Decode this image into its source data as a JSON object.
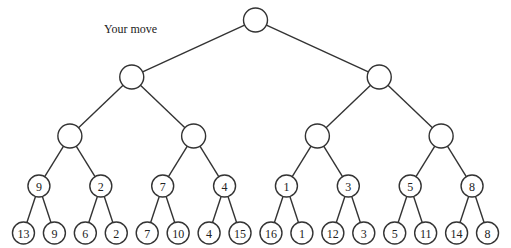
{
  "diagram": {
    "type": "game-tree",
    "annotation": "Your move",
    "root": {
      "value": "",
      "children": [
        {
          "value": "",
          "children": [
            {
              "value": "",
              "children": [
                {
                  "value": "9",
                  "children": [
                    {
                      "value": "13"
                    },
                    {
                      "value": "9"
                    }
                  ]
                },
                {
                  "value": "2",
                  "children": [
                    {
                      "value": "6"
                    },
                    {
                      "value": "2"
                    }
                  ]
                }
              ]
            },
            {
              "value": "",
              "children": [
                {
                  "value": "7",
                  "children": [
                    {
                      "value": "7"
                    },
                    {
                      "value": "10"
                    }
                  ]
                },
                {
                  "value": "4",
                  "children": [
                    {
                      "value": "4"
                    },
                    {
                      "value": "15"
                    }
                  ]
                }
              ]
            }
          ]
        },
        {
          "value": "",
          "children": [
            {
              "value": "",
              "children": [
                {
                  "value": "1",
                  "children": [
                    {
                      "value": "16"
                    },
                    {
                      "value": "1"
                    }
                  ]
                },
                {
                  "value": "3",
                  "children": [
                    {
                      "value": "12"
                    },
                    {
                      "value": "3"
                    }
                  ]
                }
              ]
            },
            {
              "value": "",
              "children": [
                {
                  "value": "5",
                  "children": [
                    {
                      "value": "5"
                    },
                    {
                      "value": "11"
                    }
                  ]
                },
                {
                  "value": "8",
                  "children": [
                    {
                      "value": "14"
                    },
                    {
                      "value": "8"
                    }
                  ]
                }
              ]
            }
          ]
        }
      ]
    }
  }
}
